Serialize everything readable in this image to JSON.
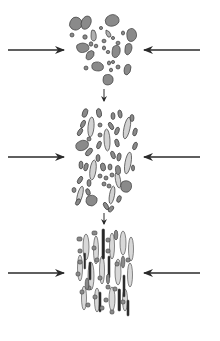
{
  "diagram": {
    "type": "process-sequence",
    "colors": {
      "background": "#ffffff",
      "arrow": "#2a2a2a",
      "grain_dark": "#7a7a7a",
      "grain_mid": "#959595",
      "grain_light": "#d2d2d2",
      "grain_stroke": "#3c3c3c",
      "grain_black": "#262626"
    },
    "stages": [
      {
        "id": "stage-1",
        "label": "Loose rounded grains",
        "center_y": 50,
        "arrow_left": {
          "x1": 8,
          "x2": 64
        },
        "arrow_right": {
          "x1": 200,
          "x2": 144
        }
      },
      {
        "id": "stage-2",
        "label": "Partially aligned grains",
        "center_y": 157,
        "arrow_left": {
          "x1": 8,
          "x2": 64
        },
        "arrow_right": {
          "x1": 200,
          "x2": 144
        }
      },
      {
        "id": "stage-3",
        "label": "Compacted elongated grains",
        "center_y": 272,
        "arrow_left": {
          "x1": 8,
          "x2": 64
        },
        "arrow_right": {
          "x1": 200,
          "x2": 144
        }
      }
    ],
    "transitions": [
      {
        "from": "stage-1",
        "to": "stage-2",
        "x": 104,
        "y1": 89,
        "y2": 101
      },
      {
        "from": "stage-2",
        "to": "stage-3",
        "x": 104,
        "y1": 213,
        "y2": 224
      }
    ]
  }
}
